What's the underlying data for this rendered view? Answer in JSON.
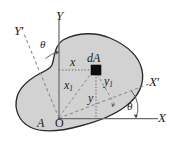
{
  "figure": {
    "kind": "rotated-axes-area-moment-diagram",
    "width": 170,
    "height": 160,
    "background": "#ffffff"
  },
  "colors": {
    "page_background": "#ffffff",
    "area_fill": "#d2d2d2",
    "area_outline": "#2a2a2a",
    "axis_line": "#6e6e6e",
    "dashed_line": "#8a8a8a",
    "dotted_line": "#5a5a5a",
    "element_square": "#0d0d0d",
    "label_text": "#1a1a1a"
  },
  "axes": [
    {
      "name": "y-axis",
      "label": "Y",
      "style": "solid",
      "orientation": "vertical"
    },
    {
      "name": "x-axis",
      "label": "X",
      "style": "solid",
      "orientation": "horizontal"
    },
    {
      "name": "y-prime-axis",
      "label": "Y",
      "prime": "′",
      "style": "dashed",
      "orientation": "rotated"
    },
    {
      "name": "x-prime-axis",
      "label": "X",
      "prime": "′",
      "style": "dashed",
      "orientation": "rotated"
    }
  ],
  "labels": {
    "y_axis": "Y",
    "x_axis": "X",
    "y_prime_axis": "Y",
    "x_prime_axis": "X",
    "prime_mark": "′",
    "theta_top": "θ",
    "theta_bottom": "θ",
    "origin": "O",
    "area": "A",
    "element": "dA",
    "x_distance": "x",
    "y_distance": "y",
    "x1_distance": "x",
    "x1_subscript": "1",
    "y1_distance": "y",
    "y1_subscript": "1"
  },
  "element": {
    "name": "dA",
    "shape": "filled-square",
    "position": {
      "x": 96,
      "y": 70
    }
  },
  "origin": {
    "x": 59,
    "y": 118
  },
  "angles": {
    "theta_between_Y_and_Yprime": "θ",
    "theta_between_X_and_Xprime": "θ"
  }
}
